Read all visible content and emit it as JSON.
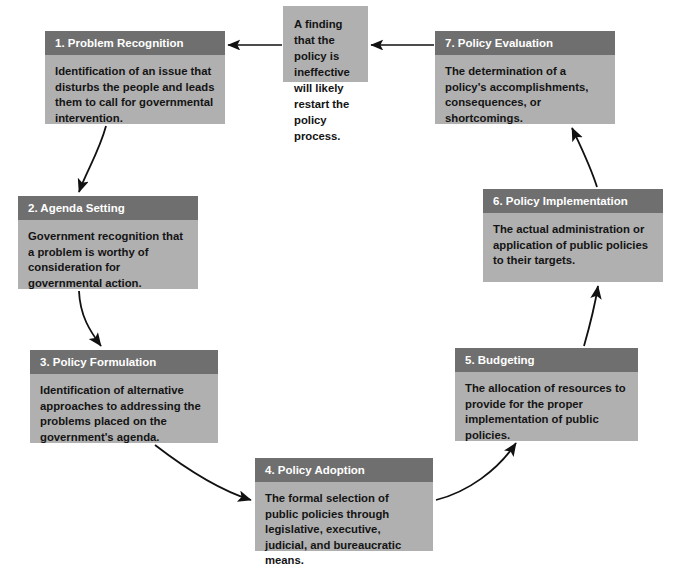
{
  "diagram": {
    "colors": {
      "header_fill": "#6f6f6f",
      "body_fill": "#b0b0b0",
      "header_text": "#ffffff",
      "body_text": "#141414",
      "arrow": "#111111",
      "background": "#ffffff"
    },
    "nodes": [
      {
        "id": "problem-recognition",
        "title": "1. Problem Recognition",
        "body": "Identification of an issue that disturbs the people and leads them to call for governmental intervention.",
        "x": 45,
        "y": 31,
        "width": 180,
        "height": 93
      },
      {
        "id": "agenda-setting",
        "title": "2. Agenda Setting",
        "body": "Government recognition that a problem is worthy of consideration for governmental action.",
        "x": 18,
        "y": 196,
        "width": 180,
        "height": 93
      },
      {
        "id": "policy-formulation",
        "title": "3. Policy Formulation",
        "body": "Identification of alternative approaches to addressing the problems placed on the government's agenda.",
        "x": 30,
        "y": 350,
        "width": 188,
        "height": 93
      },
      {
        "id": "policy-adoption",
        "title": "4. Policy Adoption",
        "body": "The formal selection of public policies through legislative, executive, judicial, and bureaucratic means.",
        "x": 255,
        "y": 458,
        "width": 178,
        "height": 93
      },
      {
        "id": "budgeting",
        "title": "5. Budgeting",
        "body": "The allocation of resources to provide for the proper implementation of public policies.",
        "x": 455,
        "y": 348,
        "width": 183,
        "height": 93
      },
      {
        "id": "policy-implementation",
        "title": "6. Policy Implementation",
        "body": "The actual administration or application of public policies to their targets.",
        "x": 483,
        "y": 189,
        "width": 180,
        "height": 93
      },
      {
        "id": "policy-evaluation",
        "title": "7. Policy Evaluation",
        "body": "The determination of a policy's accomplishments, consequences, or shortcomings.",
        "x": 435,
        "y": 31,
        "width": 180,
        "height": 93
      }
    ],
    "note": {
      "id": "restart-note",
      "body": "A finding that the policy is ineffective will likely restart the policy process.",
      "x": 283,
      "y": 6,
      "width": 85,
      "height": 76
    },
    "connectors": [
      {
        "id": "evaluation-to-note",
        "from": "policy-evaluation",
        "to": "restart-note",
        "label": "arrow-left"
      },
      {
        "id": "note-to-problem",
        "from": "restart-note",
        "to": "problem-recognition",
        "label": "arrow-left"
      },
      {
        "id": "problem-to-agenda",
        "from": "problem-recognition",
        "to": "agenda-setting",
        "label": "arrow-curved"
      },
      {
        "id": "agenda-to-formulation",
        "from": "agenda-setting",
        "to": "policy-formulation",
        "label": "arrow-curved"
      },
      {
        "id": "formulation-to-adoption",
        "from": "policy-formulation",
        "to": "policy-adoption",
        "label": "arrow-curved"
      },
      {
        "id": "adoption-to-budgeting",
        "from": "policy-adoption",
        "to": "budgeting",
        "label": "arrow-curved"
      },
      {
        "id": "budgeting-to-implementation",
        "from": "budgeting",
        "to": "policy-implementation",
        "label": "arrow-curved"
      },
      {
        "id": "implementation-to-evaluation",
        "from": "policy-implementation",
        "to": "policy-evaluation",
        "label": "arrow-curved"
      }
    ]
  }
}
